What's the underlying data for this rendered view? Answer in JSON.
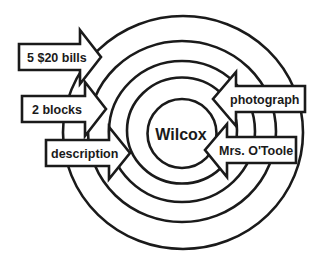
{
  "diagram": {
    "center": {
      "label": "Wilcox"
    },
    "rings": [
      {
        "cx": 183,
        "cy": 132.5,
        "rx": 120,
        "ry": 116.5
      },
      {
        "cx": 182,
        "cy": 131.5,
        "rx": 94,
        "ry": 90.5
      },
      {
        "cx": 182,
        "cy": 131.5,
        "rx": 73,
        "ry": 70.5
      },
      {
        "cx": 182,
        "cy": 130.5,
        "rx": 55,
        "ry": 53
      },
      {
        "cx": 182,
        "cy": 133.5,
        "rx": 34.5,
        "ry": 34.5
      }
    ],
    "arrows": [
      {
        "id": "five-twenty-bills",
        "label": "5 $20 bills",
        "direction": "right"
      },
      {
        "id": "two-blocks",
        "label": "2 blocks",
        "direction": "right"
      },
      {
        "id": "description",
        "label": "description",
        "direction": "right"
      },
      {
        "id": "photograph",
        "label": "photograph",
        "direction": "left"
      },
      {
        "id": "mrs-otoole",
        "label": "Mrs. O'Toole",
        "direction": "left"
      }
    ],
    "colors": {
      "stroke": "#1a1a1a",
      "fill": "#ffffff",
      "background": "#ffffff"
    }
  }
}
